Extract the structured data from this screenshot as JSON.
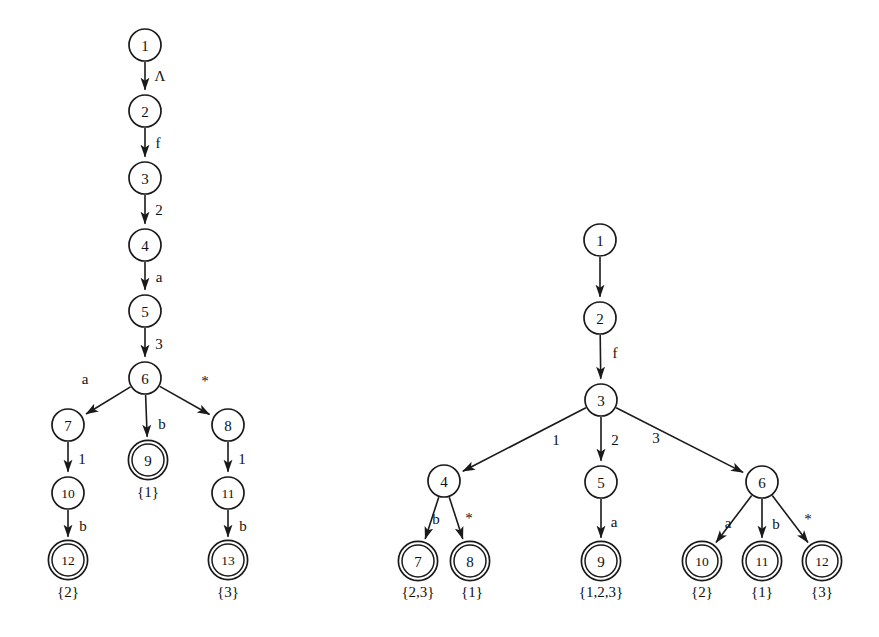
{
  "figure": {
    "kind": "two-labelled-rooted-trees",
    "background_color": "#ffffff",
    "stroke_color": "#1a1a1a",
    "text_color": "#111111"
  },
  "left_tree": {
    "nodes": [
      {
        "id": "L1",
        "label": "1",
        "cx": 145,
        "cy": 45,
        "r": 16,
        "double": false
      },
      {
        "id": "L2",
        "label": "2",
        "cx": 145,
        "cy": 111,
        "r": 16,
        "double": false
      },
      {
        "id": "L3",
        "label": "3",
        "cx": 145,
        "cy": 178,
        "r": 16,
        "double": false
      },
      {
        "id": "L4",
        "label": "4",
        "cx": 145,
        "cy": 245,
        "r": 16,
        "double": false
      },
      {
        "id": "L5",
        "label": "5",
        "cx": 145,
        "cy": 311,
        "r": 16,
        "double": false
      },
      {
        "id": "L6",
        "label": "6",
        "cx": 145,
        "cy": 378,
        "r": 16,
        "double": false
      },
      {
        "id": "L7",
        "label": "7",
        "cx": 68,
        "cy": 425,
        "r": 16,
        "double": false
      },
      {
        "id": "L8",
        "label": "8",
        "cx": 228,
        "cy": 425,
        "r": 16,
        "double": false
      },
      {
        "id": "L9",
        "label": "9",
        "cx": 148,
        "cy": 460,
        "r": 16,
        "double": true
      },
      {
        "id": "L10",
        "label": "10",
        "cx": 68,
        "cy": 493,
        "r": 16,
        "double": false
      },
      {
        "id": "L11",
        "label": "11",
        "cx": 228,
        "cy": 493,
        "r": 16,
        "double": false
      },
      {
        "id": "L12",
        "label": "12",
        "cx": 68,
        "cy": 560,
        "r": 16,
        "double": true
      },
      {
        "id": "L13",
        "label": "13",
        "cx": 228,
        "cy": 560,
        "r": 16,
        "double": true
      }
    ],
    "edges": [
      {
        "from": "L1",
        "to": "L2",
        "label": "Λ",
        "lx": 160,
        "ly": 76
      },
      {
        "from": "L2",
        "to": "L3",
        "label": "f",
        "lx": 158,
        "ly": 143
      },
      {
        "from": "L3",
        "to": "L4",
        "label": "2",
        "lx": 159,
        "ly": 210
      },
      {
        "from": "L4",
        "to": "L5",
        "label": "a",
        "lx": 159,
        "ly": 277
      },
      {
        "from": "L5",
        "to": "L6",
        "label": "3",
        "lx": 159,
        "ly": 344
      },
      {
        "from": "L6",
        "to": "L7",
        "label": "a",
        "lx": 85,
        "ly": 379
      },
      {
        "from": "L6",
        "to": "L9",
        "label": "b",
        "lx": 162,
        "ly": 424
      },
      {
        "from": "L6",
        "to": "L8",
        "label": "*",
        "lx": 205,
        "ly": 381
      },
      {
        "from": "L7",
        "to": "L10",
        "label": "1",
        "lx": 82,
        "ly": 459
      },
      {
        "from": "L8",
        "to": "L11",
        "label": "1",
        "lx": 242,
        "ly": 459
      },
      {
        "from": "L10",
        "to": "L12",
        "label": "b",
        "lx": 83,
        "ly": 526
      },
      {
        "from": "L11",
        "to": "L13",
        "label": "b",
        "lx": 243,
        "ly": 526
      }
    ],
    "accept_sets": [
      {
        "for": "L12",
        "text": "{2}",
        "x": 68,
        "y": 592
      },
      {
        "for": "L9",
        "text": "{1}",
        "x": 148,
        "y": 492
      },
      {
        "for": "L13",
        "text": "{3}",
        "x": 228,
        "y": 592
      }
    ]
  },
  "right_tree": {
    "nodes": [
      {
        "id": "R1",
        "label": "1",
        "cx": 600,
        "cy": 240,
        "r": 16,
        "double": false
      },
      {
        "id": "R2",
        "label": "2",
        "cx": 600,
        "cy": 318,
        "r": 16,
        "double": false
      },
      {
        "id": "R3",
        "label": "3",
        "cx": 601,
        "cy": 400,
        "r": 16,
        "double": false
      },
      {
        "id": "R4",
        "label": "4",
        "cx": 444,
        "cy": 481,
        "r": 16,
        "double": false
      },
      {
        "id": "R5",
        "label": "5",
        "cx": 601,
        "cy": 482,
        "r": 16,
        "double": false
      },
      {
        "id": "R6",
        "label": "6",
        "cx": 762,
        "cy": 482,
        "r": 16,
        "double": false
      },
      {
        "id": "R7",
        "label": "7",
        "cx": 418,
        "cy": 561,
        "r": 16,
        "double": true
      },
      {
        "id": "R8",
        "label": "8",
        "cx": 470,
        "cy": 561,
        "r": 16,
        "double": true
      },
      {
        "id": "R9",
        "label": "9",
        "cx": 601,
        "cy": 561,
        "r": 16,
        "double": true
      },
      {
        "id": "R10",
        "label": "10",
        "cx": 702,
        "cy": 561,
        "r": 16,
        "double": true
      },
      {
        "id": "R11",
        "label": "11",
        "cx": 762,
        "cy": 561,
        "r": 16,
        "double": true
      },
      {
        "id": "R12",
        "label": "12",
        "cx": 822,
        "cy": 561,
        "r": 16,
        "double": true
      }
    ],
    "edges": [
      {
        "from": "R1",
        "to": "R2",
        "label": "",
        "lx": 0,
        "ly": 0
      },
      {
        "from": "R2",
        "to": "R3",
        "label": "f",
        "lx": 615,
        "ly": 353
      },
      {
        "from": "R3",
        "to": "R4",
        "label": "1",
        "lx": 556,
        "ly": 440
      },
      {
        "from": "R3",
        "to": "R5",
        "label": "2",
        "lx": 615,
        "ly": 440
      },
      {
        "from": "R3",
        "to": "R6",
        "label": "3",
        "lx": 656,
        "ly": 438
      },
      {
        "from": "R4",
        "to": "R7",
        "label": "b",
        "lx": 436,
        "ly": 519
      },
      {
        "from": "R4",
        "to": "R8",
        "label": "*",
        "lx": 469,
        "ly": 518
      },
      {
        "from": "R5",
        "to": "R9",
        "label": "a",
        "lx": 614,
        "ly": 522
      },
      {
        "from": "R6",
        "to": "R10",
        "label": "a",
        "lx": 728,
        "ly": 523
      },
      {
        "from": "R6",
        "to": "R11",
        "label": "b",
        "lx": 776,
        "ly": 524
      },
      {
        "from": "R6",
        "to": "R12",
        "label": "*",
        "lx": 808,
        "ly": 519
      }
    ],
    "accept_sets": [
      {
        "for": "R7",
        "text": "{2,3}",
        "x": 418,
        "y": 592
      },
      {
        "for": "R8",
        "text": "{1}",
        "x": 472,
        "y": 592
      },
      {
        "for": "R9",
        "text": "{1,2,3}",
        "x": 601,
        "y": 592
      },
      {
        "for": "R10",
        "text": "{2}",
        "x": 702,
        "y": 592
      },
      {
        "for": "R11",
        "text": "{1}",
        "x": 762,
        "y": 592
      },
      {
        "for": "R12",
        "text": "{3}",
        "x": 822,
        "y": 592
      }
    ]
  }
}
